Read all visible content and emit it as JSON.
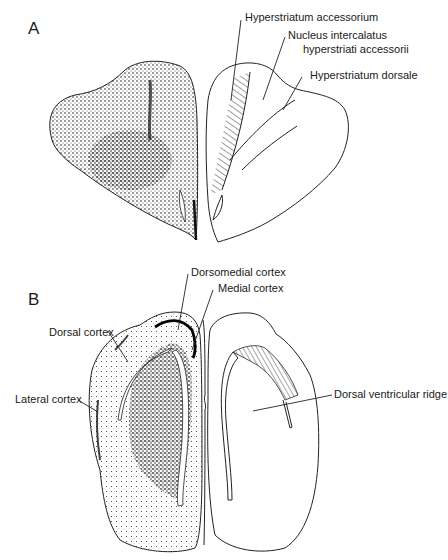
{
  "panels": [
    {
      "id": "A",
      "label": "A",
      "annotations": [
        {
          "text": "Hyperstriatum accessorium"
        },
        {
          "text": "Nucleus intercalatus"
        },
        {
          "text": "hyperstriati accessorii"
        },
        {
          "text": "Hyperstriatum dorsale"
        }
      ]
    },
    {
      "id": "B",
      "label": "B",
      "annotations": [
        {
          "text": "Dorsomedial cortex"
        },
        {
          "text": "Medial cortex"
        },
        {
          "text": "Dorsal cortex"
        },
        {
          "text": "Lateral cortex"
        },
        {
          "text": "Dorsal ventricular ridge"
        }
      ]
    }
  ],
  "colors": {
    "ink": "#222222",
    "stipple": "#1a1a1a",
    "background": "#ffffff"
  }
}
